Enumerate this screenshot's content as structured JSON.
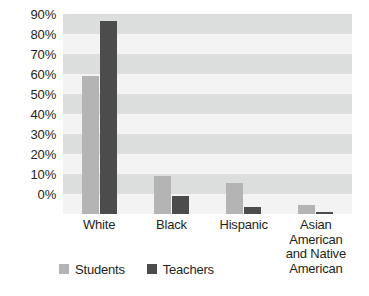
{
  "chart_data": {
    "type": "bar",
    "title": "",
    "subtitle": "",
    "xlabel": "",
    "ylabel": "",
    "categories": [
      "White",
      "Black",
      "Hispanic",
      "Asian American and Native American"
    ],
    "series": [
      {
        "name": "Students",
        "color": "#b4b4b4",
        "values": [
          62,
          17,
          14,
          4
        ]
      },
      {
        "name": "Teachers",
        "color": "#4c4c4c",
        "values": [
          87,
          8,
          3,
          1
        ]
      }
    ],
    "ylim": [
      0,
      90
    ],
    "ytick_values": [
      0,
      10,
      20,
      30,
      40,
      50,
      60,
      70,
      80,
      90
    ],
    "ytick_labels": [
      "0%",
      "10%",
      "20%",
      "30%",
      "40%",
      "50%",
      "60%",
      "70%",
      "80%",
      "90%"
    ],
    "grid": "horizontal-alternating-bands",
    "legend_position": "bottom-left",
    "value_labels": false
  },
  "axis": {
    "y": {
      "labels": [
        "90%",
        "80%",
        "70%",
        "60%",
        "50%",
        "40%",
        "30%",
        "20%",
        "10%",
        "0%"
      ]
    },
    "x": {
      "labels": [
        "White",
        "Black",
        "Hispanic",
        "Asian\nAmerican\nand Native\nAmerican"
      ]
    }
  },
  "legend": {
    "items": [
      {
        "label": "Students",
        "color": "#b4b4b4"
      },
      {
        "label": "Teachers",
        "color": "#4c4c4c"
      }
    ]
  },
  "colors": {
    "students": "#b4b4b4",
    "teachers": "#4c4c4c",
    "band_shaded": "#dcdddd",
    "band_plain": "#f3f3f3",
    "text": "#231f20"
  }
}
